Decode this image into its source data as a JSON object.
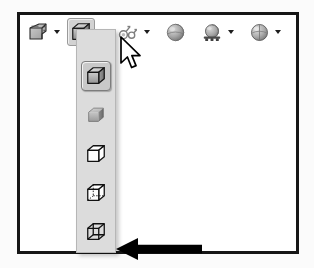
{
  "window": {
    "title": "Display Style toolbar with flyout menu open",
    "frame_color": "#161616",
    "background": "#ffffff"
  },
  "toolbar": {
    "name": "view-display-toolbar",
    "background": "#ffffff",
    "items": [
      {
        "id": "section-view",
        "icon": "section-view-icon",
        "label": "Section View",
        "has_caret": true,
        "pressed": false
      },
      {
        "id": "display-style",
        "icon": "shaded-with-edges-cube-icon",
        "label": "Display Style",
        "has_caret": true,
        "pressed": true
      },
      {
        "id": "hide-show-items",
        "icon": "hide-show-items-icon",
        "label": "Hide/Show Items",
        "has_caret": true,
        "pressed": false
      },
      {
        "id": "edit-appearance",
        "icon": "sphere-appearance-icon",
        "label": "Edit Appearance",
        "has_caret": false,
        "pressed": false
      },
      {
        "id": "apply-scene",
        "icon": "scene-sphere-icon",
        "label": "Apply Scene",
        "has_caret": true,
        "pressed": false
      },
      {
        "id": "view-settings",
        "icon": "shadow-sphere-icon",
        "label": "View Settings",
        "has_caret": true,
        "pressed": false
      }
    ]
  },
  "flyout": {
    "name": "display-style-flyout",
    "open": true,
    "background": "#dcdcdc",
    "border_color": "#b6b6b6",
    "selected_index": 0,
    "items": [
      {
        "id": "shaded-with-edges",
        "icon": "shaded-with-edges-cube-icon",
        "label": "Shaded With Edges",
        "selected": true
      },
      {
        "id": "shaded",
        "icon": "shaded-cube-icon",
        "label": "Shaded",
        "selected": false
      },
      {
        "id": "hidden-lines-removed",
        "icon": "hidden-lines-removed-cube-icon",
        "label": "Hidden Lines Removed",
        "selected": false
      },
      {
        "id": "hidden-lines-visible",
        "icon": "hidden-lines-visible-cube-icon",
        "label": "Hidden Lines Visible",
        "selected": false
      },
      {
        "id": "wireframe",
        "icon": "wireframe-cube-icon",
        "label": "Wireframe",
        "selected": false
      }
    ]
  },
  "annotations": {
    "callout_arrow": {
      "name": "callout-arrow",
      "points_to": "wireframe",
      "color": "#000000",
      "direction": "left"
    },
    "cursor": {
      "name": "mouse-cursor",
      "type": "arrow-pointer",
      "over": "display-style-caret"
    }
  }
}
